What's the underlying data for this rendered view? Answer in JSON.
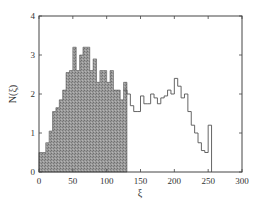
{
  "chart_data": {
    "type": "bar",
    "title": "",
    "xlabel": "ξ",
    "ylabel": "N(ξ)",
    "xlim": [
      0,
      300
    ],
    "ylim": [
      0,
      4
    ],
    "xticks": [
      0,
      50,
      100,
      150,
      200,
      250,
      300
    ],
    "yticks": [
      0,
      1,
      2,
      3,
      4
    ],
    "grid": false,
    "bin_width": 5,
    "series": [
      {
        "name": "shaded",
        "style": "filled",
        "color": "#8c8c8c",
        "x": [
          0,
          5,
          10,
          15,
          20,
          25,
          30,
          35,
          40,
          45,
          50,
          55,
          60,
          65,
          70,
          75,
          80,
          85,
          90,
          95,
          100,
          105,
          110,
          115,
          120,
          125
        ],
        "values": [
          0.5,
          0.5,
          0.75,
          1.05,
          1.55,
          1.65,
          1.85,
          2.1,
          2.55,
          2.6,
          3.2,
          2.6,
          3.0,
          3.2,
          3.2,
          2.6,
          2.9,
          2.3,
          2.6,
          2.6,
          2.3,
          2.6,
          2.1,
          2.1,
          1.85,
          2.3
        ]
      },
      {
        "name": "outline",
        "style": "step",
        "color": "#555555",
        "x": [
          125,
          130,
          135,
          140,
          145,
          150,
          155,
          160,
          165,
          170,
          175,
          180,
          185,
          190,
          195,
          200,
          205,
          210,
          215,
          220,
          225,
          230,
          235,
          240,
          245,
          250
        ],
        "values": [
          2.1,
          2.0,
          1.7,
          1.55,
          1.55,
          1.95,
          1.75,
          1.75,
          2.0,
          1.9,
          1.75,
          1.9,
          1.95,
          2.1,
          2.0,
          2.4,
          2.2,
          1.9,
          2.0,
          1.55,
          1.2,
          1.0,
          0.75,
          0.55,
          0.5,
          1.2
        ]
      }
    ]
  },
  "labels": {
    "xlabel": "ξ",
    "ylabel": "N(ξ)",
    "xticks": [
      "0",
      "50",
      "100",
      "150",
      "200",
      "250",
      "300"
    ],
    "yticks": [
      "0",
      "1",
      "2",
      "3",
      "4"
    ]
  }
}
